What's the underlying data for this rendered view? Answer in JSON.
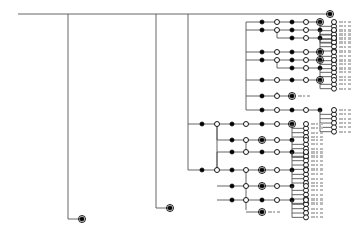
{
  "figure": {
    "kind": "cladogram",
    "title": "",
    "background_color": "#ffffff",
    "branch_color": "#555555",
    "node_fill_color": "#000000",
    "node_open_color": "#ffffff",
    "node_stroke_color": "#000000",
    "ring_color": "#000000",
    "label_color": "#b9b9b9",
    "width": 355,
    "height": 235
  },
  "legend": {
    "filled_node": "derived-character-state",
    "open_node": "reversal-character-state",
    "ringed_node": "terminal-taxon-marker",
    "dashed_label": "taxon-name-placeholder"
  },
  "chart_data": {
    "type": "tree",
    "spine_y": 14,
    "spine_x0": 18,
    "spine_x1": 330,
    "spine_nodes": [
      {
        "x": 18,
        "state": "filled"
      },
      {
        "x": 36,
        "state": "open"
      },
      {
        "x": 52,
        "state": "filled"
      },
      {
        "x": 68,
        "state": "open"
      },
      {
        "x": 82,
        "state": "filled"
      },
      {
        "x": 98,
        "state": "open"
      },
      {
        "x": 112,
        "state": "filled"
      },
      {
        "x": 127,
        "state": "open"
      },
      {
        "x": 142,
        "state": "filled"
      },
      {
        "x": 156,
        "state": "open"
      },
      {
        "x": 171,
        "state": "filled"
      },
      {
        "x": 188,
        "state": "open"
      },
      {
        "x": 202,
        "state": "filled"
      },
      {
        "x": 217,
        "state": "open"
      },
      {
        "x": 232,
        "state": "filled"
      },
      {
        "x": 246,
        "state": "open"
      },
      {
        "x": 262,
        "state": "filled"
      },
      {
        "x": 277,
        "state": "open"
      },
      {
        "x": 292,
        "state": "filled"
      },
      {
        "x": 306,
        "state": "open"
      },
      {
        "x": 320,
        "state": "filled"
      }
    ],
    "long_branches": [
      {
        "from_x": 68,
        "to_y": 219,
        "tip_x": 82,
        "tip": "ringed"
      },
      {
        "from_x": 156,
        "to_y": 208,
        "tip_x": 170,
        "tip": "ringed"
      }
    ],
    "clade_stems": [
      {
        "x": 188,
        "y_top": 14,
        "y_bottom": 170
      },
      {
        "x": 217,
        "y_top": 124,
        "y_bottom": 170
      },
      {
        "x": 246,
        "y_top": 22,
        "y_bottom": 110
      },
      {
        "x": 277,
        "y_top": 30,
        "y_bottom": 38
      },
      {
        "x": 277,
        "y_top": 60,
        "y_bottom": 68
      },
      {
        "x": 277,
        "y_top": 92,
        "y_bottom": 96
      },
      {
        "x": 217,
        "y_top": 124,
        "y_bottom": 140
      },
      {
        "x": 217,
        "y_top": 152,
        "y_bottom": 170
      },
      {
        "x": 246,
        "y_top": 140,
        "y_bottom": 152
      },
      {
        "x": 246,
        "y_top": 170,
        "y_bottom": 186
      },
      {
        "x": 246,
        "y_top": 186,
        "y_bottom": 210
      }
    ],
    "branch_rows": [
      {
        "y": 22,
        "x_start": 246,
        "nodes": [
          {
            "x": 262,
            "state": "filled"
          },
          {
            "x": 277,
            "state": "open"
          },
          {
            "x": 292,
            "state": "filled"
          },
          {
            "x": 306,
            "state": "open"
          },
          {
            "x": 320,
            "state": "ringed"
          }
        ],
        "terminals": 4
      },
      {
        "y": 30,
        "x_start": 246,
        "nodes": [
          {
            "x": 262,
            "state": "filled"
          },
          {
            "x": 277,
            "state": "open"
          },
          {
            "x": 292,
            "state": "filled"
          },
          {
            "x": 306,
            "state": "open"
          },
          {
            "x": 320,
            "state": "filled"
          }
        ],
        "terminals": 3
      },
      {
        "y": 38,
        "x_start": 277,
        "nodes": [
          {
            "x": 292,
            "state": "filled"
          },
          {
            "x": 306,
            "state": "open"
          },
          {
            "x": 320,
            "state": "filled"
          }
        ],
        "terminals": 3
      },
      {
        "y": 52,
        "x_start": 246,
        "nodes": [
          {
            "x": 262,
            "state": "filled"
          },
          {
            "x": 277,
            "state": "open"
          },
          {
            "x": 292,
            "state": "filled"
          },
          {
            "x": 306,
            "state": "open"
          },
          {
            "x": 320,
            "state": "ringed"
          }
        ],
        "terminals": 2
      },
      {
        "y": 60,
        "x_start": 246,
        "nodes": [
          {
            "x": 262,
            "state": "filled"
          },
          {
            "x": 277,
            "state": "open"
          },
          {
            "x": 292,
            "state": "filled"
          },
          {
            "x": 306,
            "state": "open"
          },
          {
            "x": 320,
            "state": "ringed"
          }
        ],
        "terminals": 2
      },
      {
        "y": 68,
        "x_start": 277,
        "nodes": [
          {
            "x": 292,
            "state": "filled"
          },
          {
            "x": 306,
            "state": "open"
          },
          {
            "x": 320,
            "state": "filled"
          }
        ],
        "terminals": 2
      },
      {
        "y": 80,
        "x_start": 246,
        "nodes": [
          {
            "x": 262,
            "state": "filled"
          },
          {
            "x": 277,
            "state": "open"
          },
          {
            "x": 292,
            "state": "filled"
          },
          {
            "x": 306,
            "state": "open"
          },
          {
            "x": 320,
            "state": "ringed"
          }
        ],
        "terminals": 2
      },
      {
        "y": 96,
        "x_start": 246,
        "nodes": [
          {
            "x": 262,
            "state": "filled"
          },
          {
            "x": 277,
            "state": "open"
          },
          {
            "x": 292,
            "state": "ringed"
          }
        ],
        "terminals": 0
      },
      {
        "y": 110,
        "x_start": 246,
        "nodes": [
          {
            "x": 262,
            "state": "filled"
          },
          {
            "x": 277,
            "state": "open"
          },
          {
            "x": 292,
            "state": "filled"
          },
          {
            "x": 306,
            "state": "open"
          },
          {
            "x": 320,
            "state": "filled"
          }
        ],
        "terminals": 5
      },
      {
        "y": 124,
        "x_start": 188,
        "nodes": [
          {
            "x": 202,
            "state": "filled"
          },
          {
            "x": 217,
            "state": "open"
          },
          {
            "x": 232,
            "state": "filled"
          },
          {
            "x": 246,
            "state": "open"
          },
          {
            "x": 262,
            "state": "filled"
          },
          {
            "x": 277,
            "state": "open"
          },
          {
            "x": 292,
            "state": "ringed"
          }
        ],
        "terminals": 3
      },
      {
        "y": 140,
        "x_start": 217,
        "nodes": [
          {
            "x": 232,
            "state": "filled"
          },
          {
            "x": 246,
            "state": "open"
          },
          {
            "x": 262,
            "state": "ringed"
          },
          {
            "x": 277,
            "state": "open"
          },
          {
            "x": 292,
            "state": "filled"
          }
        ],
        "terminals": 4
      },
      {
        "y": 152,
        "x_start": 217,
        "nodes": [
          {
            "x": 232,
            "state": "filled"
          },
          {
            "x": 246,
            "state": "open"
          },
          {
            "x": 262,
            "state": "filled"
          },
          {
            "x": 277,
            "state": "open"
          },
          {
            "x": 292,
            "state": "filled"
          }
        ],
        "terminals": 4
      },
      {
        "y": 170,
        "x_start": 188,
        "nodes": [
          {
            "x": 202,
            "state": "filled"
          },
          {
            "x": 217,
            "state": "open"
          },
          {
            "x": 232,
            "state": "filled"
          },
          {
            "x": 246,
            "state": "open"
          },
          {
            "x": 262,
            "state": "ringed"
          },
          {
            "x": 277,
            "state": "open"
          },
          {
            "x": 292,
            "state": "filled"
          }
        ],
        "terminals": 3
      },
      {
        "y": 186,
        "x_start": 217,
        "nodes": [
          {
            "x": 232,
            "state": "filled"
          },
          {
            "x": 246,
            "state": "open"
          },
          {
            "x": 262,
            "state": "ringed"
          },
          {
            "x": 277,
            "state": "open"
          },
          {
            "x": 292,
            "state": "filled"
          }
        ],
        "terminals": 4
      },
      {
        "y": 200,
        "x_start": 217,
        "nodes": [
          {
            "x": 232,
            "state": "filled"
          },
          {
            "x": 246,
            "state": "open"
          },
          {
            "x": 262,
            "state": "filled"
          },
          {
            "x": 277,
            "state": "open"
          },
          {
            "x": 292,
            "state": "filled"
          }
        ],
        "terminals": 4
      },
      {
        "y": 212,
        "x_start": 246,
        "nodes": [
          {
            "x": 262,
            "state": "ringed"
          }
        ],
        "terminals": 0
      }
    ],
    "terminal_column_upper_x": 320,
    "terminal_column_lower_x": 292,
    "terminal_open_offset": 14,
    "terminal_row_spacing": 7,
    "label_dash_x_upper": 340,
    "label_dash_x_lower": 312
  }
}
